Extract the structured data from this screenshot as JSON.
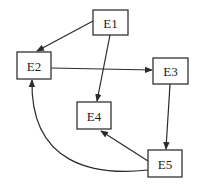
{
  "diagram": {
    "type": "directed-graph",
    "nodes": [
      {
        "id": "E1",
        "label": "E1",
        "x": 93,
        "y": 10,
        "w": 35,
        "h": 25
      },
      {
        "id": "E2",
        "label": "E2",
        "x": 17,
        "y": 52,
        "w": 34,
        "h": 27
      },
      {
        "id": "E3",
        "label": "E3",
        "x": 153,
        "y": 58,
        "w": 35,
        "h": 26
      },
      {
        "id": "E4",
        "label": "E4",
        "x": 77,
        "y": 102,
        "w": 34,
        "h": 27
      },
      {
        "id": "E5",
        "label": "E5",
        "x": 148,
        "y": 150,
        "w": 34,
        "h": 27
      }
    ],
    "edges": [
      {
        "from": "E1",
        "to": "E2",
        "path": "M93,21 L37,51"
      },
      {
        "from": "E1",
        "to": "E4",
        "path": "M110,35 L97,101"
      },
      {
        "from": "E2",
        "to": "E3",
        "path": "M51,68 L152,70"
      },
      {
        "from": "E3",
        "to": "E5",
        "path": "M170,84 L166,149"
      },
      {
        "from": "E5",
        "to": "E4",
        "path": "M148,161 L101,131"
      },
      {
        "from": "E5",
        "to": "E2",
        "path": "M148,170 C95,176 30,165 32,80"
      }
    ],
    "colors": {
      "stroke": "#333333",
      "background": "#ffffff"
    }
  }
}
